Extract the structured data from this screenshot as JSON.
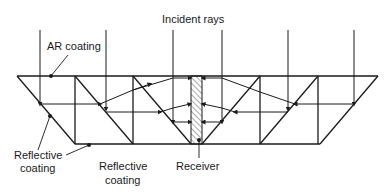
{
  "diagram": {
    "type": "optical-concentrator-cross-section",
    "colors": {
      "stroke": "#1a1a1a",
      "background": "#ffffff"
    },
    "labels": {
      "incident_rays": "Incident rays",
      "ar_coating": "AR coating",
      "reflective_coating_left_line1": "Reflective",
      "reflective_coating_left_line2": "coating",
      "reflective_coating_bottom_line1": "Reflective",
      "reflective_coating_bottom_line2": "coating",
      "receiver": "Receiver"
    },
    "incident_ray_x": [
      40,
      106,
      173,
      222,
      288,
      354
    ]
  }
}
